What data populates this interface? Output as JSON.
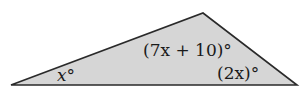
{
  "diagram": {
    "shape": "triangle",
    "fill_color": "#d6d6d6",
    "stroke_color": "#2a2a2a",
    "vertices": {
      "left": [
        11,
        85
      ],
      "apex": [
        203,
        13
      ],
      "right": [
        297,
        85
      ]
    },
    "angles": {
      "left": "x°",
      "apex": "(7x + 10)°",
      "right": "(2x)°"
    }
  }
}
